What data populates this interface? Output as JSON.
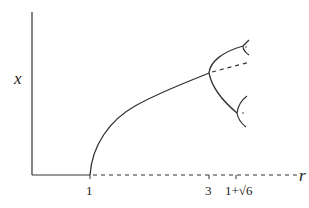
{
  "diagram": {
    "axes": {
      "y_label": "x",
      "x_label": "r"
    },
    "ticks": [
      {
        "label": "1",
        "x": 90
      },
      {
        "label": "3",
        "x": 209
      },
      {
        "label": "1+√6",
        "x": 243
      }
    ],
    "colors": {
      "line": "#333333",
      "background": "#ffffff"
    },
    "legend_notes": {
      "solid": "stable fixed point / cycle",
      "dashed": "unstable fixed point / cycle"
    }
  }
}
